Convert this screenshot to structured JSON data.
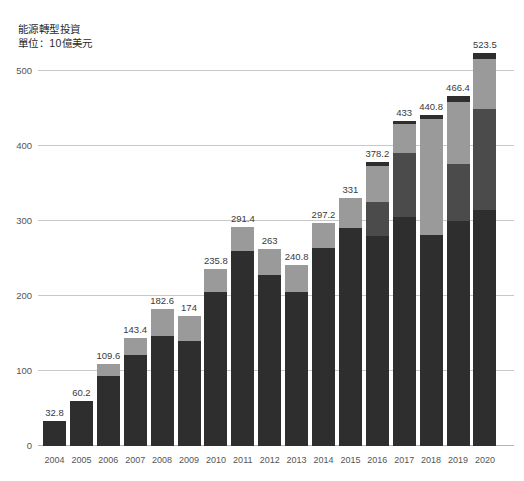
{
  "chart_data": {
    "type": "bar",
    "title": "能源轉型投資",
    "subtitle": "單位：10億美元",
    "xlabel": "",
    "ylabel": "",
    "ylim": [
      0,
      520
    ],
    "yticks": [
      0,
      100,
      200,
      300,
      400,
      500
    ],
    "grid": true,
    "legend": "none",
    "stacked": true,
    "categories": [
      "2004",
      "2005",
      "2006",
      "2007",
      "2008",
      "2009",
      "2010",
      "2011",
      "2012",
      "2013",
      "2014",
      "2015",
      "2016",
      "2017",
      "2018",
      "2019",
      "2020"
    ],
    "values": [
      32.8,
      60.2,
      109.6,
      143.4,
      182.6,
      174,
      235.8,
      291.4,
      263,
      240.8,
      297.2,
      331,
      378.2,
      433,
      440.8,
      466.4,
      523.5
    ],
    "value_labels": [
      "32.8",
      "60.2",
      "109.6",
      "143.4",
      "182.6",
      "174",
      "235.8",
      "291.4",
      "263",
      "240.8",
      "297.2",
      "331",
      "378.2",
      "433",
      "440.8",
      "466.4",
      "523.5"
    ],
    "series": [
      {
        "name": "segment-1",
        "color": "#2e2e2e",
        "values": [
          32.8,
          60.2,
          94.0,
          122.0,
          147.0,
          140.0,
          206.0,
          260.0,
          228.0,
          206.0,
          264.0,
          291.0,
          280.0,
          305.0,
          281.0,
          300.0,
          315.0
        ]
      },
      {
        "name": "segment-2",
        "color": "#4b4b4b",
        "values": [
          0,
          0,
          0,
          0,
          0,
          0,
          0,
          0,
          0,
          0,
          0,
          0,
          46.0,
          86.0,
          0,
          76.0,
          135.0
        ]
      },
      {
        "name": "segment-3",
        "color": "#9a9a9a",
        "values": [
          0,
          0,
          15.6,
          21.4,
          35.6,
          34.0,
          29.8,
          31.4,
          35.0,
          34.8,
          33.2,
          40.0,
          47.2,
          38.0,
          155.0,
          83.0,
          66.0
        ]
      },
      {
        "name": "segment-4",
        "color": "#2e2e2e",
        "values": [
          0,
          0,
          0,
          0,
          0,
          0,
          0,
          0,
          0,
          0,
          0,
          0,
          5.0,
          4.0,
          4.8,
          7.4,
          7.5
        ]
      }
    ]
  },
  "colors": {
    "segment_dark": "#2e2e2e",
    "segment_medium": "#4b4b4b",
    "segment_light": "#9a9a9a",
    "gridline": "#c9c9c9",
    "text": "#333333"
  }
}
